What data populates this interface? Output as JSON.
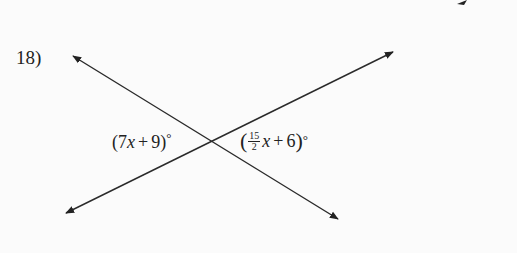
{
  "problem": {
    "number_label": "18)"
  },
  "diagram": {
    "type": "intersecting-lines",
    "intersection": {
      "x": 212,
      "y": 141
    },
    "line_color": "#222222",
    "background": "#fbfbfb",
    "lines": [
      {
        "name": "line-a",
        "from": {
          "x": 66,
          "y": 213
        },
        "to": {
          "x": 393,
          "y": 52
        },
        "arrows": [
          "start",
          "end"
        ]
      },
      {
        "name": "line-b",
        "from": {
          "x": 73,
          "y": 56
        },
        "to": {
          "x": 338,
          "y": 219
        },
        "arrows": [
          "start",
          "end"
        ]
      }
    ],
    "corner_mark": {
      "x": 462,
      "y": 2
    }
  },
  "angles": {
    "left": {
      "open": "(",
      "coef": "7",
      "var": "x",
      "op": "+",
      "const": "9",
      "close": ")",
      "unit": "°"
    },
    "right": {
      "open": "(",
      "frac_num": "15",
      "frac_den": "2",
      "var": "x",
      "op": "+",
      "const": "6",
      "close": ")",
      "unit": "°"
    }
  }
}
